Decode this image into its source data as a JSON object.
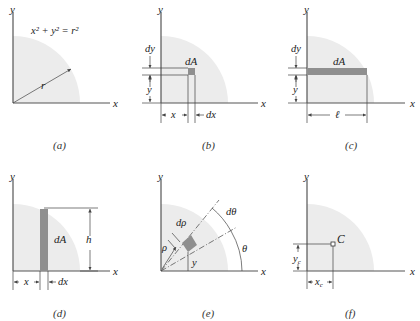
{
  "panels": [
    {
      "id": "a",
      "caption": "(a)",
      "axis_x": "x",
      "axis_y": "y",
      "equation": "x² + y² = r²",
      "radius_label": "r"
    },
    {
      "id": "b",
      "caption": "(b)",
      "axis_x": "x",
      "axis_y": "y",
      "element_label": "dA",
      "dims": {
        "dy": "dy",
        "y": "y",
        "x": "x",
        "dx": "dx"
      }
    },
    {
      "id": "c",
      "caption": "(c)",
      "axis_x": "x",
      "axis_y": "y",
      "element_label": "dA",
      "dims": {
        "dy": "dy",
        "y": "y",
        "length": "ℓ"
      }
    },
    {
      "id": "d",
      "caption": "(d)",
      "axis_x": "x",
      "axis_y": "y",
      "element_label": "dA",
      "dims": {
        "h": "h",
        "x": "x",
        "dx": "dx"
      }
    },
    {
      "id": "e",
      "caption": "(e)",
      "axis_x": "x",
      "axis_y": "y",
      "dims": {
        "drho": "dρ",
        "rho": "ρ",
        "dtheta": "dθ",
        "theta": "θ",
        "y": "y"
      }
    },
    {
      "id": "f",
      "caption": "(f)",
      "axis_x": "x",
      "axis_y": "y",
      "centroid_label": "C",
      "dims": {
        "yc": "y",
        "yc_sub": "c",
        "xc": "x",
        "xc_sub": "c"
      }
    }
  ],
  "colors": {
    "quarter_circle_fill": "#ececec",
    "element_fill": "#8f8f8f",
    "axis": "#555555"
  }
}
